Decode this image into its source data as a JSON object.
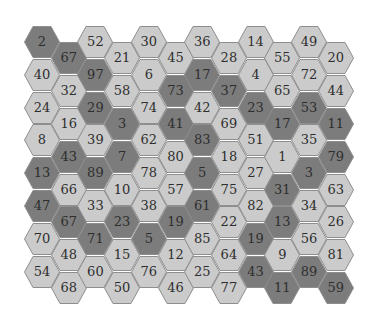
{
  "puzzle": {
    "colors": {
      "dark": "#7c7c7c",
      "light": "#cbcbcb",
      "border": "#8e8e8e",
      "text": "#2e2e2e"
    },
    "columns": [
      {
        "cells": [
          {
            "n": "2",
            "d": 1
          },
          {
            "n": "40",
            "d": 0
          },
          {
            "n": "24",
            "d": 0
          },
          {
            "n": "8",
            "d": 0
          },
          {
            "n": "13",
            "d": 1
          },
          {
            "n": "47",
            "d": 1
          },
          {
            "n": "70",
            "d": 0
          },
          {
            "n": "54",
            "d": 0
          }
        ]
      },
      {
        "cells": [
          {
            "n": "67",
            "d": 1
          },
          {
            "n": "32",
            "d": 0
          },
          {
            "n": "16",
            "d": 0
          },
          {
            "n": "43",
            "d": 1
          },
          {
            "n": "66",
            "d": 0
          },
          {
            "n": "67",
            "d": 1
          },
          {
            "n": "48",
            "d": 0
          },
          {
            "n": "68",
            "d": 0
          }
        ]
      },
      {
        "cells": [
          {
            "n": "52",
            "d": 0
          },
          {
            "n": "97",
            "d": 1
          },
          {
            "n": "29",
            "d": 1
          },
          {
            "n": "39",
            "d": 0
          },
          {
            "n": "89",
            "d": 1
          },
          {
            "n": "33",
            "d": 0
          },
          {
            "n": "71",
            "d": 1
          },
          {
            "n": "60",
            "d": 0
          }
        ]
      },
      {
        "cells": [
          {
            "n": "21",
            "d": 0
          },
          {
            "n": "58",
            "d": 0
          },
          {
            "n": "3",
            "d": 1
          },
          {
            "n": "7",
            "d": 1
          },
          {
            "n": "10",
            "d": 0
          },
          {
            "n": "23",
            "d": 1
          },
          {
            "n": "15",
            "d": 0
          },
          {
            "n": "50",
            "d": 0
          }
        ]
      },
      {
        "cells": [
          {
            "n": "30",
            "d": 0
          },
          {
            "n": "6",
            "d": 0
          },
          {
            "n": "74",
            "d": 0
          },
          {
            "n": "62",
            "d": 0
          },
          {
            "n": "78",
            "d": 0
          },
          {
            "n": "38",
            "d": 0
          },
          {
            "n": "5",
            "d": 1
          },
          {
            "n": "76",
            "d": 0
          }
        ]
      },
      {
        "cells": [
          {
            "n": "45",
            "d": 0
          },
          {
            "n": "73",
            "d": 1
          },
          {
            "n": "41",
            "d": 1
          },
          {
            "n": "80",
            "d": 0
          },
          {
            "n": "57",
            "d": 0
          },
          {
            "n": "19",
            "d": 1
          },
          {
            "n": "12",
            "d": 0
          },
          {
            "n": "46",
            "d": 0
          }
        ]
      },
      {
        "cells": [
          {
            "n": "36",
            "d": 0
          },
          {
            "n": "17",
            "d": 1
          },
          {
            "n": "42",
            "d": 0
          },
          {
            "n": "83",
            "d": 1
          },
          {
            "n": "5",
            "d": 1
          },
          {
            "n": "61",
            "d": 1
          },
          {
            "n": "85",
            "d": 0
          },
          {
            "n": "25",
            "d": 0
          }
        ]
      },
      {
        "cells": [
          {
            "n": "28",
            "d": 0
          },
          {
            "n": "37",
            "d": 1
          },
          {
            "n": "69",
            "d": 0
          },
          {
            "n": "18",
            "d": 0
          },
          {
            "n": "75",
            "d": 0
          },
          {
            "n": "22",
            "d": 0
          },
          {
            "n": "64",
            "d": 0
          },
          {
            "n": "77",
            "d": 0
          }
        ]
      },
      {
        "cells": [
          {
            "n": "14",
            "d": 0
          },
          {
            "n": "4",
            "d": 0
          },
          {
            "n": "23",
            "d": 1
          },
          {
            "n": "51",
            "d": 0
          },
          {
            "n": "27",
            "d": 0
          },
          {
            "n": "82",
            "d": 0
          },
          {
            "n": "19",
            "d": 1
          },
          {
            "n": "43",
            "d": 1
          }
        ]
      },
      {
        "cells": [
          {
            "n": "55",
            "d": 0
          },
          {
            "n": "65",
            "d": 0
          },
          {
            "n": "17",
            "d": 1
          },
          {
            "n": "1",
            "d": 0
          },
          {
            "n": "31",
            "d": 1
          },
          {
            "n": "13",
            "d": 1
          },
          {
            "n": "9",
            "d": 0
          },
          {
            "n": "11",
            "d": 1
          }
        ]
      },
      {
        "cells": [
          {
            "n": "49",
            "d": 0
          },
          {
            "n": "72",
            "d": 0
          },
          {
            "n": "53",
            "d": 1
          },
          {
            "n": "35",
            "d": 0
          },
          {
            "n": "3",
            "d": 1
          },
          {
            "n": "34",
            "d": 0
          },
          {
            "n": "56",
            "d": 0
          },
          {
            "n": "89",
            "d": 1
          }
        ]
      },
      {
        "cells": [
          {
            "n": "20",
            "d": 0
          },
          {
            "n": "44",
            "d": 0
          },
          {
            "n": "11",
            "d": 1
          },
          {
            "n": "79",
            "d": 1
          },
          {
            "n": "63",
            "d": 0
          },
          {
            "n": "26",
            "d": 0
          },
          {
            "n": "81",
            "d": 0
          },
          {
            "n": "59",
            "d": 1
          }
        ]
      }
    ]
  }
}
